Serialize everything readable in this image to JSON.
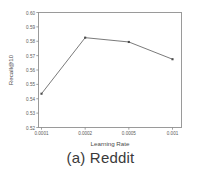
{
  "figure": {
    "caption": "(a) Reddit"
  },
  "chart_data": {
    "type": "line",
    "title": "",
    "xlabel": "Learning Rate",
    "ylabel": "Recall@10",
    "categories": [
      "0.0001",
      "0.0002",
      "0.0005",
      "0.001"
    ],
    "x_tick_labels": [
      "0.0001",
      "0.0002",
      "0.0005",
      "0.001"
    ],
    "y_tick_labels": [
      "0.52",
      "0.53",
      "0.54",
      "0.55",
      "0.56",
      "0.57",
      "0.58",
      "0.59",
      "0.60"
    ],
    "y_ticks": [
      0.52,
      0.53,
      0.54,
      0.55,
      0.56,
      0.57,
      0.58,
      0.59,
      0.6
    ],
    "ylim": [
      0.52,
      0.6
    ],
    "values": [
      0.5435,
      0.5825,
      0.5795,
      0.5675
    ],
    "series": [
      {
        "name": "Recall@10",
        "values": [
          0.5435,
          0.5825,
          0.5795,
          0.5675
        ]
      }
    ],
    "grid": false,
    "legend": false,
    "marker": "square",
    "line_color": "#6b6b6b",
    "marker_color": "#4a4a4a",
    "axis_color": "#8a8a8a",
    "tick_label_color": "#5a5a5a"
  }
}
